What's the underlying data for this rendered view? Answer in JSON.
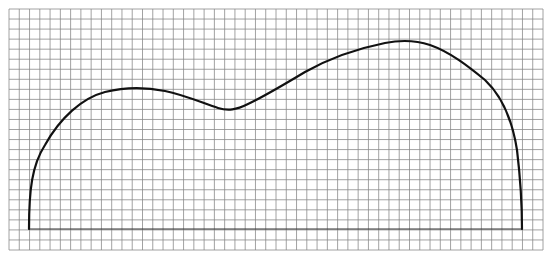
{
  "figure": {
    "type": "curve-on-grid",
    "grid": {
      "left": 9,
      "top": 9,
      "right": 543,
      "bottom": 250,
      "columns": 52,
      "rows": 24,
      "line_color": "#8a8a8a",
      "line_width": 0.8
    },
    "baseline": {
      "x1": 29,
      "x2": 522,
      "y": 229,
      "color": "#333333",
      "width": 1.2
    },
    "curve": {
      "color": "#111111",
      "width": 2.2,
      "path": "M29,229 C29,190 32,165 45,145 C60,118 82,98 105,92 C125,87 145,87 165,91 C185,95 205,104 218,108 C228,111 236,110 248,104 C265,96 285,84 305,72 C330,58 360,48 385,43 C400,40 415,40 430,45 C450,52 468,66 485,80 C502,96 512,118 517,150 C520,175 522,200 522,229"
    },
    "key_points": [
      {
        "label": "left-base",
        "x": 29,
        "y": 229
      },
      {
        "label": "first-peak",
        "x": 127,
        "y": 88
      },
      {
        "label": "dip",
        "x": 227,
        "y": 110
      },
      {
        "label": "second-peak",
        "x": 403,
        "y": 41
      },
      {
        "label": "right-base",
        "x": 522,
        "y": 229
      }
    ]
  }
}
